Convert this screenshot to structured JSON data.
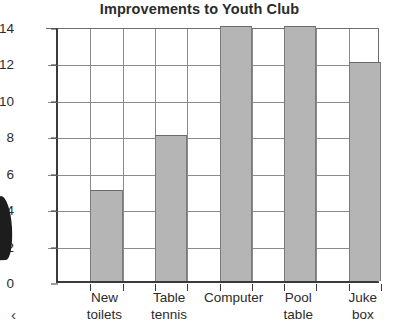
{
  "chart_data": {
    "type": "bar",
    "title": "Improvements to Youth Club",
    "xlabel": "",
    "ylabel": "",
    "categories": [
      "New toilets",
      "Table tennis",
      "Computer",
      "Pool table",
      "Juke box"
    ],
    "category_lines": [
      [
        "New",
        "toilets"
      ],
      [
        "Table",
        "tennis"
      ],
      [
        "Computer",
        ""
      ],
      [
        "Pool",
        "table"
      ],
      [
        "Juke",
        "box"
      ]
    ],
    "values": [
      5,
      8,
      14,
      14,
      12
    ],
    "ylim": [
      0,
      14
    ],
    "ytick_step": 2,
    "yticks": [
      0,
      2,
      4,
      6,
      8,
      10,
      12,
      14
    ],
    "ytick_labels": [
      "0",
      "2",
      "4",
      "6",
      "8",
      "10",
      "12",
      "14"
    ],
    "grid": "both",
    "legend": "none",
    "bar_fill_color": "#b5b5b5",
    "bar_edge_color": "#7a7a7a",
    "grid_color": "#8a8a8a",
    "axis_color": "#3a3a3a",
    "title_color": "#2b2b2b"
  },
  "artifacts": {
    "corner_glyph": "‹"
  }
}
